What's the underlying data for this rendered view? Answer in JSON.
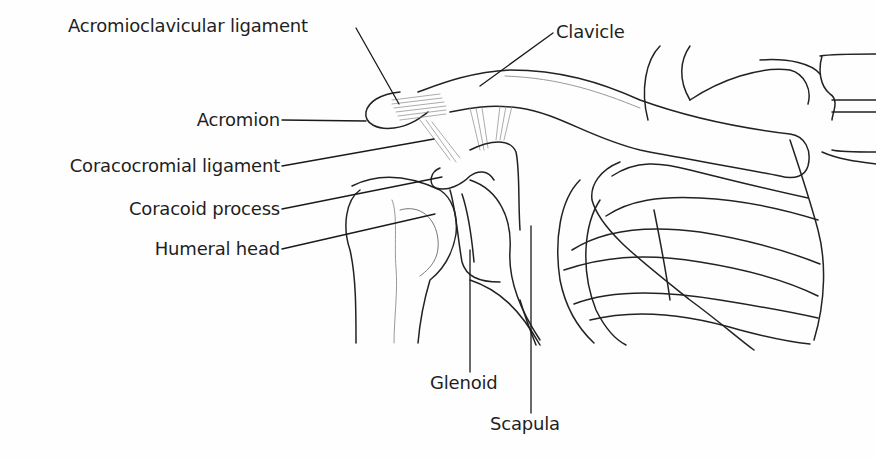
{
  "diagram": {
    "labels": {
      "acromioclavicular_ligament": "Acromioclavicular ligament",
      "clavicle": "Clavicle",
      "acromion": "Acromion",
      "coracocromial_ligament": "Coracocromial ligament",
      "coracoid_process": "Coracoid process",
      "humeral_head": "Humeral head",
      "glenoid": "Glenoid",
      "scapula": "Scapula"
    },
    "colors": {
      "background": "#fefefe",
      "line": "#1f1f1f",
      "text": "#1f1f1f"
    }
  }
}
